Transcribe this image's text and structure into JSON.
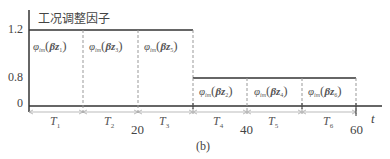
{
  "diagram": {
    "title": "工况调整因子",
    "caption": "(b)",
    "x_axis_label": "t",
    "y_ticks": [
      "1.2",
      "0.8",
      "0"
    ],
    "x_ticks": [
      "20",
      "40",
      "60"
    ],
    "segments": [
      {
        "period": "T",
        "period_sub": "1",
        "level": "1.2",
        "phi": "φ",
        "phi_sub": "im",
        "beta": "β",
        "z": "z",
        "z_sub": "1"
      },
      {
        "period": "T",
        "period_sub": "2",
        "level": "1.2",
        "phi": "φ",
        "phi_sub": "im",
        "beta": "β",
        "z": "z",
        "z_sub": "3"
      },
      {
        "period": "T",
        "period_sub": "3",
        "level": "1.2",
        "phi": "φ",
        "phi_sub": "im",
        "beta": "β",
        "z": "z",
        "z_sub": "5"
      },
      {
        "period": "T",
        "period_sub": "4",
        "level": "0.8",
        "phi": "φ",
        "phi_sub": "im",
        "beta": "β",
        "z": "z",
        "z_sub": "2"
      },
      {
        "period": "T",
        "period_sub": "5",
        "level": "0.8",
        "phi": "φ",
        "phi_sub": "im",
        "beta": "β",
        "z": "z",
        "z_sub": "4"
      },
      {
        "period": "T",
        "period_sub": "6",
        "level": "0.8",
        "phi": "φ",
        "phi_sub": "im",
        "beta": "β",
        "z": "z",
        "z_sub": "6"
      }
    ],
    "colors": {
      "line": "#333333",
      "dashed": "#999999",
      "arrow": "#aaaaaa"
    }
  }
}
